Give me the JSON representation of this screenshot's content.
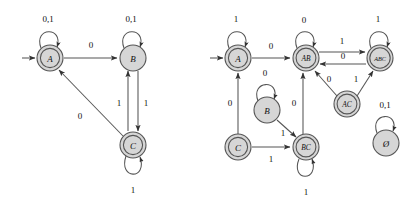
{
  "figure": {
    "type": "finite-automata-diagram",
    "background_color": "#ffffff",
    "state_fill_color": "#d6d6d6",
    "stroke_color": "#555555",
    "label_color": "#111111",
    "diagrams": [
      {
        "id": "left-nfa",
        "name": "left-automaton",
        "states": [
          {
            "id": "A",
            "label": "A",
            "cx": 50,
            "cy": 58,
            "r": 13,
            "accepting": true,
            "start": true
          },
          {
            "id": "B",
            "label": "B",
            "cx": 133,
            "cy": 58,
            "r": 13,
            "accepting": false,
            "start": false
          },
          {
            "id": "C",
            "label": "C",
            "cx": 133,
            "cy": 145,
            "r": 13,
            "accepting": true,
            "start": false
          }
        ],
        "transitions": [
          {
            "from": "A",
            "to": "A",
            "label": "0,1",
            "kind": "self-loop-top"
          },
          {
            "from": "A",
            "to": "B",
            "label": "0",
            "kind": "straight"
          },
          {
            "from": "B",
            "to": "B",
            "label": "0,1",
            "kind": "self-loop-top"
          },
          {
            "from": "B",
            "to": "C",
            "label": "1",
            "kind": "vertical-down"
          },
          {
            "from": "C",
            "to": "B",
            "label": "1",
            "kind": "vertical-up"
          },
          {
            "from": "C",
            "to": "A",
            "label": "0",
            "kind": "diagonal"
          },
          {
            "from": "C",
            "to": "C",
            "label": "1",
            "kind": "self-loop-bottom"
          }
        ]
      },
      {
        "id": "right-dfa",
        "name": "right-automaton",
        "states": [
          {
            "id": "A",
            "label": "A",
            "cx": 238,
            "cy": 58,
            "r": 13,
            "accepting": true,
            "start": true
          },
          {
            "id": "AB",
            "label": "AB",
            "cx": 306,
            "cy": 58,
            "r": 13,
            "accepting": true,
            "start": false
          },
          {
            "id": "ABC",
            "label": "ABC",
            "cx": 380,
            "cy": 58,
            "r": 13,
            "accepting": true,
            "start": false
          },
          {
            "id": "B",
            "label": "B",
            "cx": 267,
            "cy": 110,
            "r": 13,
            "accepting": false,
            "start": false
          },
          {
            "id": "AC",
            "label": "AC",
            "cx": 347,
            "cy": 104,
            "r": 13,
            "accepting": true,
            "start": false
          },
          {
            "id": "C",
            "label": "C",
            "cx": 238,
            "cy": 147,
            "r": 13,
            "accepting": true,
            "start": false
          },
          {
            "id": "BC",
            "label": "BC",
            "cx": 306,
            "cy": 147,
            "r": 13,
            "accepting": true,
            "start": false
          },
          {
            "id": "EMPTY",
            "label": "Ø",
            "cx": 386,
            "cy": 143,
            "r": 13,
            "accepting": false,
            "start": false
          }
        ],
        "transitions": [
          {
            "from": "A",
            "to": "A",
            "label": "1",
            "kind": "self-loop-top"
          },
          {
            "from": "A",
            "to": "AB",
            "label": "0",
            "kind": "straight"
          },
          {
            "from": "AB",
            "to": "AB",
            "label": "0",
            "kind": "self-loop-top"
          },
          {
            "from": "AB",
            "to": "ABC",
            "label": "1",
            "kind": "straight"
          },
          {
            "from": "ABC",
            "to": "AB",
            "label": "0",
            "kind": "straight-back"
          },
          {
            "from": "ABC",
            "to": "ABC",
            "label": "1",
            "kind": "self-loop-top"
          },
          {
            "from": "B",
            "to": "B",
            "label": "0",
            "kind": "self-loop-top"
          },
          {
            "from": "B",
            "to": "BC",
            "label": "1",
            "kind": "diagonal"
          },
          {
            "from": "C",
            "to": "A",
            "label": "0",
            "kind": "vertical-up"
          },
          {
            "from": "C",
            "to": "BC",
            "label": "1",
            "kind": "straight"
          },
          {
            "from": "BC",
            "to": "AB",
            "label": "0",
            "kind": "vertical-up"
          },
          {
            "from": "BC",
            "to": "BC",
            "label": "1",
            "kind": "self-loop-bottom"
          },
          {
            "from": "AC",
            "to": "AB",
            "label": "0",
            "kind": "diagonal"
          },
          {
            "from": "AC",
            "to": "ABC",
            "label": "1",
            "kind": "diagonal"
          },
          {
            "from": "EMPTY",
            "to": "EMPTY",
            "label": "0,1",
            "kind": "self-loop-top"
          }
        ]
      }
    ],
    "edge_labels": {
      "l_a_loop": "0,1",
      "l_a_b": "0",
      "l_b_loop": "0,1",
      "l_b_c": "1",
      "l_c_b": "1",
      "l_c_a": "0",
      "l_c_loop": "1",
      "r_a_loop": "1",
      "r_a_ab": "0",
      "r_ab_loop": "0",
      "r_ab_abc": "1",
      "r_abc_ab": "0",
      "r_abc_loop": "1",
      "r_b_loop": "0",
      "r_b_bc": "1",
      "r_c_a": "0",
      "r_c_bc": "1",
      "r_bc_ab": "0",
      "r_bc_loop": "1",
      "r_ac_ab": "0",
      "r_ac_abc": "1",
      "r_empty_loop": "0,1"
    },
    "state_labels": {
      "lA": "A",
      "lB": "B",
      "lC": "C",
      "rA": "A",
      "rAB": "AB",
      "rABC": "ABC",
      "rB": "B",
      "rAC": "AC",
      "rC": "C",
      "rBC": "BC",
      "rEMPTY": "Ø"
    }
  }
}
